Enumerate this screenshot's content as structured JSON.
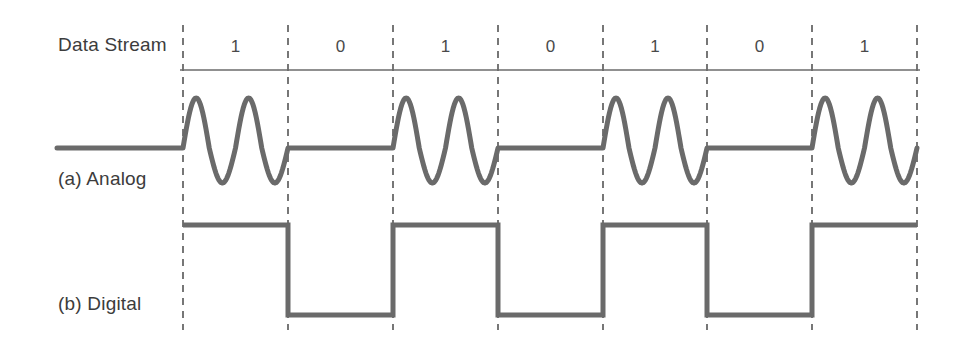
{
  "figure": {
    "background_color": "#ffffff",
    "stroke_color": "#6a6a6a",
    "grid_color": "#555555",
    "text_color": "#3c3c3c"
  },
  "labels": {
    "data_stream": "Data Stream",
    "analog": "(a) Analog",
    "digital": "(b) Digital"
  },
  "chart_data": {
    "type": "line",
    "xlabel": "",
    "ylabel": "",
    "grid": true,
    "legend_position": "none",
    "bit_labels": [
      "1",
      "0",
      "1",
      "0",
      "1",
      "0",
      "1"
    ],
    "bits": [
      1,
      0,
      1,
      0,
      1,
      0,
      1
    ],
    "bit_count": 7,
    "boundaries_px": [
      183,
      288,
      393,
      498,
      603,
      707,
      812,
      917
    ],
    "bit_width_px": 105,
    "series": [
      {
        "name": "(a) Analog",
        "encoding": "amplitude-shift-keying",
        "baseline_y_px": 148,
        "peak_y_px": 98,
        "trough_y_px": 183,
        "cycles_per_one_bit": 2,
        "lead_in_x_px": 57,
        "values": [
          1,
          0,
          1,
          0,
          1,
          0,
          1
        ]
      },
      {
        "name": "(b) Digital",
        "encoding": "nrz-level",
        "high_y_px": 225,
        "low_y_px": 315,
        "lead_in_x_px": 183,
        "values": [
          1,
          0,
          1,
          0,
          1,
          0,
          1
        ]
      }
    ],
    "rows": [
      {
        "label": "Data Stream",
        "rule_y_px": 70,
        "rule_x_start_px": 180,
        "rule_x_end_px": 920
      },
      {
        "label": "(a) Analog",
        "label_y_px": 178
      },
      {
        "label": "(b) Digital",
        "label_y_px": 303
      }
    ],
    "grid_y_top_px": 25,
    "grid_y_bottom_px": 330
  }
}
